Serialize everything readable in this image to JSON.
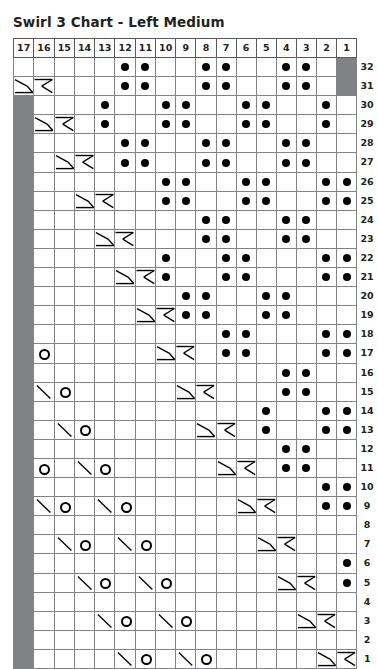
{
  "title": "Swirl 3 Chart - Left Medium",
  "colors": {
    "shaded_cell": "#808285",
    "grid_line": "#808285",
    "header_border": "#58595b",
    "symbol": "#000000",
    "text": "#231f20",
    "background": "#ffffff"
  },
  "grid": {
    "column_headers": [
      17,
      16,
      15,
      14,
      13,
      12,
      11,
      10,
      9,
      8,
      7,
      6,
      5,
      4,
      3,
      2,
      1
    ],
    "row_labels": [
      32,
      31,
      30,
      29,
      28,
      27,
      26,
      25,
      24,
      23,
      22,
      21,
      20,
      19,
      18,
      17,
      16,
      15,
      14,
      13,
      12,
      11,
      10,
      9,
      8,
      7,
      6,
      5,
      4,
      3,
      2,
      1
    ],
    "columns": 17,
    "rows": 32,
    "symbol_legend": {
      "dot": "purl-stitch-dot",
      "circle": "yarn-over-circle",
      "backslash": "left-leaning-decrease",
      "right-cross": "right-cross-cable",
      "left-cross": "left-cross-cable",
      "shaded": "no-stitch-shaded"
    }
  },
  "chart_data": {
    "type": "table",
    "title": "Swirl 3 Chart - Left Medium",
    "xlabel": "Stitch number",
    "ylabel": "Row number",
    "categories": [
      17,
      16,
      15,
      14,
      13,
      12,
      11,
      10,
      9,
      8,
      7,
      6,
      5,
      4,
      3,
      2,
      1
    ],
    "rows": [
      {
        "label": 32,
        "cells": [
          "",
          "",
          "",
          "",
          "",
          "dot",
          "dot",
          "",
          "",
          "dot",
          "dot",
          "",
          "",
          "dot",
          "dot",
          "",
          "shaded"
        ]
      },
      {
        "label": 31,
        "cells": [
          "right-cross",
          "left-cross",
          "",
          "",
          "",
          "dot",
          "dot",
          "",
          "",
          "dot",
          "dot",
          "",
          "",
          "dot",
          "dot",
          "",
          "shaded"
        ]
      },
      {
        "label": 30,
        "cells": [
          "shaded",
          "",
          "",
          "",
          "dot",
          "",
          "",
          "dot",
          "dot",
          "",
          "",
          "dot",
          "dot",
          "",
          "",
          "dot",
          ""
        ]
      },
      {
        "label": 29,
        "cells": [
          "shaded",
          "right-cross",
          "left-cross",
          "",
          "dot",
          "",
          "",
          "dot",
          "dot",
          "",
          "",
          "dot",
          "dot",
          "",
          "",
          "dot",
          ""
        ]
      },
      {
        "label": 28,
        "cells": [
          "shaded",
          "",
          "",
          "",
          "",
          "dot",
          "dot",
          "",
          "",
          "dot",
          "dot",
          "",
          "",
          "dot",
          "dot",
          "",
          ""
        ]
      },
      {
        "label": 27,
        "cells": [
          "shaded",
          "",
          "right-cross",
          "left-cross",
          "",
          "dot",
          "dot",
          "",
          "",
          "dot",
          "dot",
          "",
          "",
          "dot",
          "dot",
          "",
          ""
        ]
      },
      {
        "label": 26,
        "cells": [
          "shaded",
          "",
          "",
          "",
          "",
          "",
          "",
          "dot",
          "dot",
          "",
          "",
          "dot",
          "dot",
          "",
          "",
          "dot",
          "dot"
        ]
      },
      {
        "label": 25,
        "cells": [
          "shaded",
          "",
          "",
          "right-cross",
          "left-cross",
          "",
          "",
          "dot",
          "dot",
          "",
          "",
          "dot",
          "dot",
          "",
          "",
          "dot",
          "dot"
        ]
      },
      {
        "label": 24,
        "cells": [
          "shaded",
          "",
          "",
          "",
          "",
          "",
          "",
          "",
          "",
          "dot",
          "dot",
          "",
          "",
          "dot",
          "dot",
          "",
          ""
        ]
      },
      {
        "label": 23,
        "cells": [
          "shaded",
          "",
          "",
          "",
          "right-cross",
          "left-cross",
          "",
          "",
          "",
          "dot",
          "dot",
          "",
          "",
          "dot",
          "dot",
          "",
          ""
        ]
      },
      {
        "label": 22,
        "cells": [
          "shaded",
          "",
          "",
          "",
          "",
          "",
          "",
          "dot",
          "",
          "",
          "dot",
          "dot",
          "",
          "",
          "",
          "dot",
          "dot"
        ]
      },
      {
        "label": 21,
        "cells": [
          "shaded",
          "",
          "",
          "",
          "",
          "right-cross",
          "left-cross",
          "dot",
          "",
          "",
          "dot",
          "dot",
          "",
          "",
          "",
          "dot",
          "dot"
        ]
      },
      {
        "label": 20,
        "cells": [
          "shaded",
          "",
          "",
          "",
          "",
          "",
          "",
          "",
          "dot",
          "dot",
          "",
          "",
          "dot",
          "dot",
          "",
          "",
          ""
        ]
      },
      {
        "label": 19,
        "cells": [
          "shaded",
          "",
          "",
          "",
          "",
          "",
          "right-cross",
          "left-cross",
          "dot",
          "dot",
          "",
          "",
          "dot",
          "dot",
          "",
          "",
          ""
        ]
      },
      {
        "label": 18,
        "cells": [
          "shaded",
          "",
          "",
          "",
          "",
          "",
          "",
          "",
          "",
          "",
          "dot",
          "dot",
          "",
          "",
          "",
          "dot",
          "dot"
        ]
      },
      {
        "label": 17,
        "cells": [
          "shaded",
          "circle",
          "",
          "",
          "",
          "",
          "",
          "right-cross",
          "left-cross",
          "",
          "dot",
          "dot",
          "",
          "",
          "",
          "dot",
          "dot"
        ]
      },
      {
        "label": 16,
        "cells": [
          "shaded",
          "",
          "",
          "",
          "",
          "",
          "",
          "",
          "",
          "",
          "",
          "",
          "",
          "dot",
          "dot",
          "",
          ""
        ]
      },
      {
        "label": 15,
        "cells": [
          "shaded",
          "backslash",
          "circle",
          "",
          "",
          "",
          "",
          "",
          "right-cross",
          "left-cross",
          "",
          "",
          "",
          "dot",
          "dot",
          "",
          ""
        ]
      },
      {
        "label": 14,
        "cells": [
          "shaded",
          "",
          "",
          "",
          "",
          "",
          "",
          "",
          "",
          "",
          "",
          "",
          "dot",
          "",
          "",
          "dot",
          "dot"
        ]
      },
      {
        "label": 13,
        "cells": [
          "shaded",
          "",
          "backslash",
          "circle",
          "",
          "",
          "",
          "",
          "",
          "right-cross",
          "left-cross",
          "",
          "dot",
          "",
          "",
          "dot",
          "dot"
        ]
      },
      {
        "label": 12,
        "cells": [
          "shaded",
          "",
          "",
          "",
          "",
          "",
          "",
          "",
          "",
          "",
          "",
          "",
          "",
          "dot",
          "dot",
          "",
          ""
        ]
      },
      {
        "label": 11,
        "cells": [
          "shaded",
          "circle",
          "",
          "backslash",
          "circle",
          "",
          "",
          "",
          "",
          "",
          "right-cross",
          "left-cross",
          "",
          "dot",
          "dot",
          "",
          ""
        ]
      },
      {
        "label": 10,
        "cells": [
          "shaded",
          "",
          "",
          "",
          "",
          "",
          "",
          "",
          "",
          "",
          "",
          "",
          "",
          "",
          "",
          "dot",
          "dot"
        ]
      },
      {
        "label": 9,
        "cells": [
          "shaded",
          "backslash",
          "circle",
          "",
          "backslash",
          "circle",
          "",
          "",
          "",
          "",
          "",
          "right-cross",
          "left-cross",
          "",
          "",
          "dot",
          "dot"
        ]
      },
      {
        "label": 8,
        "cells": [
          "shaded",
          "",
          "",
          "",
          "",
          "",
          "",
          "",
          "",
          "",
          "",
          "",
          "",
          "",
          "",
          "",
          ""
        ]
      },
      {
        "label": 7,
        "cells": [
          "shaded",
          "",
          "backslash",
          "circle",
          "",
          "backslash",
          "circle",
          "",
          "",
          "",
          "",
          "",
          "right-cross",
          "left-cross",
          "",
          "",
          ""
        ]
      },
      {
        "label": 6,
        "cells": [
          "shaded",
          "",
          "",
          "",
          "",
          "",
          "",
          "",
          "",
          "",
          "",
          "",
          "",
          "",
          "",
          "",
          "dot"
        ]
      },
      {
        "label": 5,
        "cells": [
          "shaded",
          "",
          "",
          "backslash",
          "circle",
          "",
          "backslash",
          "circle",
          "",
          "",
          "",
          "",
          "",
          "right-cross",
          "left-cross",
          "",
          "dot"
        ]
      },
      {
        "label": 4,
        "cells": [
          "shaded",
          "",
          "",
          "",
          "",
          "",
          "",
          "",
          "",
          "",
          "",
          "",
          "",
          "",
          "",
          "",
          ""
        ]
      },
      {
        "label": 3,
        "cells": [
          "shaded",
          "",
          "",
          "",
          "backslash",
          "circle",
          "",
          "backslash",
          "circle",
          "",
          "",
          "",
          "",
          "",
          "right-cross",
          "left-cross",
          ""
        ]
      },
      {
        "label": 2,
        "cells": [
          "shaded",
          "",
          "",
          "",
          "",
          "",
          "",
          "",
          "",
          "",
          "",
          "",
          "",
          "",
          "",
          "",
          ""
        ]
      },
      {
        "label": 1,
        "cells": [
          "shaded",
          "",
          "",
          "",
          "",
          "backslash",
          "circle",
          "",
          "backslash",
          "circle",
          "",
          "",
          "",
          "",
          "",
          "right-cross",
          "left-cross"
        ]
      }
    ]
  }
}
